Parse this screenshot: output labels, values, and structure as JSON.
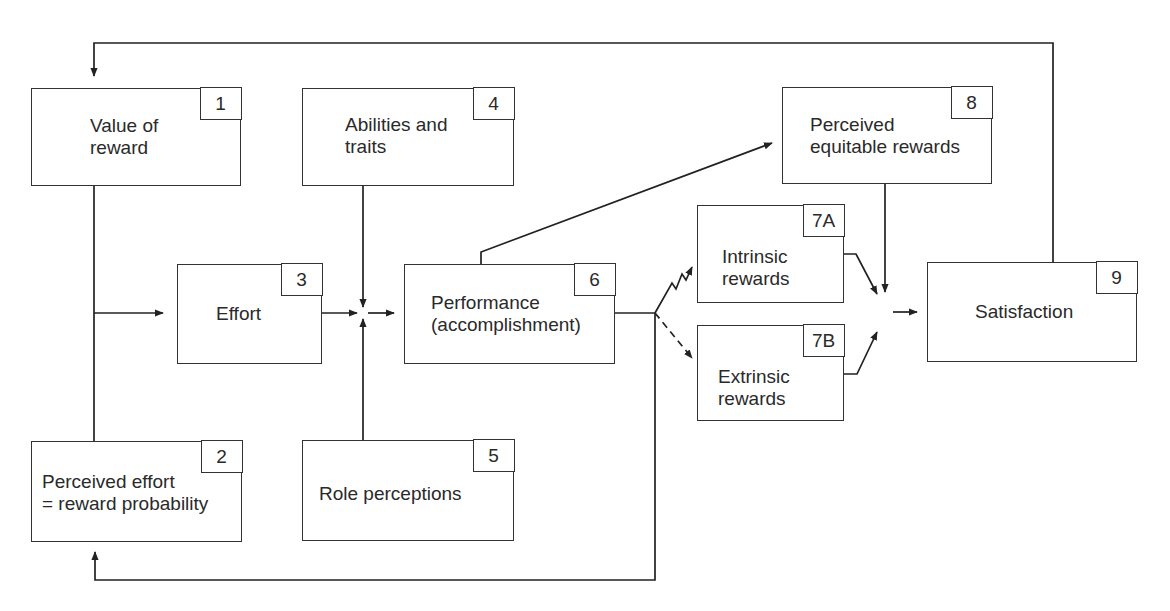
{
  "diagram": {
    "type": "flow-model",
    "boxes": [
      {
        "id": "1",
        "label": "Value of\nreward"
      },
      {
        "id": "2",
        "label": "Perceived effort\n= reward probability"
      },
      {
        "id": "3",
        "label": "Effort"
      },
      {
        "id": "4",
        "label": "Abilities and\ntraits"
      },
      {
        "id": "5",
        "label": "Role perceptions"
      },
      {
        "id": "6",
        "label": "Performance\n(accomplishment)"
      },
      {
        "id": "7A",
        "label": "Intrinsic\nrewards"
      },
      {
        "id": "7B",
        "label": "Extrinsic\nrewards"
      },
      {
        "id": "8",
        "label": "Perceived\nequitable rewards"
      },
      {
        "id": "9",
        "label": "Satisfaction"
      }
    ],
    "edges": [
      {
        "from": "1",
        "to": "3",
        "style": "solid"
      },
      {
        "from": "2",
        "to": "3",
        "style": "solid"
      },
      {
        "from": "3",
        "to": "6",
        "style": "solid"
      },
      {
        "from": "4",
        "to": "6",
        "style": "solid"
      },
      {
        "from": "5",
        "to": "6",
        "style": "solid"
      },
      {
        "from": "6",
        "to": "7A",
        "style": "zigzag"
      },
      {
        "from": "6",
        "to": "7B",
        "style": "dashed"
      },
      {
        "from": "6",
        "to": "8",
        "style": "solid"
      },
      {
        "from": "6",
        "to": "2",
        "style": "feedback"
      },
      {
        "from": "7A",
        "to": "9",
        "style": "solid"
      },
      {
        "from": "7B",
        "to": "9",
        "style": "solid"
      },
      {
        "from": "8",
        "to": "9",
        "style": "solid"
      },
      {
        "from": "9",
        "to": "1",
        "style": "feedback"
      }
    ]
  }
}
